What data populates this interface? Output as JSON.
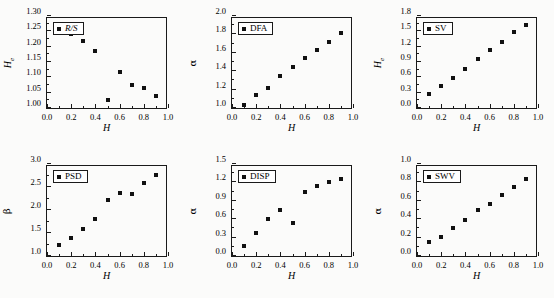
{
  "figure": {
    "background": "#fbfbfa",
    "marker_color": "#111111",
    "axis_color": "#1a1a1a"
  },
  "chart_data": [
    {
      "type": "scatter",
      "panel_index": 0,
      "legend": "R/S",
      "legend_italic": true,
      "title": "",
      "xlabel": "H",
      "ylabel": "H",
      "ylabel_sub": "e",
      "x": [
        0.1,
        0.2,
        0.3,
        0.4,
        0.5,
        0.6,
        0.7,
        0.8,
        0.9
      ],
      "values": [
        1.245,
        1.24,
        1.22,
        1.186,
        1.027,
        1.118,
        1.076,
        1.065,
        1.04
      ],
      "xlim": [
        0.0,
        1.0
      ],
      "ylim": [
        1.0,
        1.3
      ],
      "xticks": [
        0.0,
        0.2,
        0.4,
        0.6,
        0.8,
        1.0
      ],
      "xticklabels": [
        "0.0",
        "0.2",
        "0.4",
        "0.6",
        "0.8",
        "1.0"
      ],
      "yticks": [
        1.0,
        1.05,
        1.1,
        1.15,
        1.2,
        1.25,
        1.3
      ],
      "yticklabels": [
        "1.00",
        "1.05",
        "1.10",
        "1.15",
        "1.20",
        "1.25",
        "1.30"
      ],
      "grid": false,
      "legend_position": "top-left"
    },
    {
      "type": "scatter",
      "panel_index": 1,
      "legend": "DFA",
      "legend_italic": false,
      "title": "",
      "xlabel": "H",
      "ylabel": "α",
      "ylabel_sub": "",
      "x": [
        0.1,
        0.2,
        0.3,
        0.4,
        0.5,
        0.6,
        0.7,
        0.8,
        0.9
      ],
      "values": [
        1.03,
        1.14,
        1.22,
        1.35,
        1.45,
        1.54,
        1.63,
        1.72,
        1.81
      ],
      "xlim": [
        0.0,
        1.0
      ],
      "ylim": [
        1.0,
        2.0
      ],
      "xticks": [
        0.0,
        0.2,
        0.4,
        0.6,
        0.8,
        1.0
      ],
      "xticklabels": [
        "0.0",
        "0.2",
        "0.4",
        "0.6",
        "0.8",
        "1.0"
      ],
      "yticks": [
        1.0,
        1.2,
        1.4,
        1.6,
        1.8,
        2.0
      ],
      "yticklabels": [
        "1.0",
        "1.2",
        "1.4",
        "1.6",
        "1.8",
        "2.0"
      ],
      "grid": false,
      "legend_position": "top-left"
    },
    {
      "type": "scatter",
      "panel_index": 2,
      "legend": "SV",
      "legend_italic": false,
      "title": "",
      "xlabel": "H",
      "ylabel": "H",
      "ylabel_sub": "e",
      "x": [
        0.1,
        0.2,
        0.3,
        0.4,
        0.5,
        0.6,
        0.7,
        0.8,
        0.9
      ],
      "values": [
        0.28,
        0.43,
        0.59,
        0.77,
        0.96,
        1.13,
        1.3,
        1.48,
        1.63
      ],
      "xlim": [
        0.0,
        1.0
      ],
      "ylim": [
        0.0,
        1.8
      ],
      "xticks": [
        0.0,
        0.2,
        0.4,
        0.6,
        0.8,
        1.0
      ],
      "xticklabels": [
        "0.0",
        "0.2",
        "0.4",
        "0.6",
        "0.8",
        "1.0"
      ],
      "yticks": [
        0.0,
        0.3,
        0.6,
        0.9,
        1.2,
        1.5,
        1.8
      ],
      "yticklabels": [
        "0.0",
        "0.3",
        "0.6",
        "0.9",
        "1.2",
        "1.5",
        "1.8"
      ],
      "grid": false,
      "legend_position": "top-left"
    },
    {
      "type": "scatter",
      "panel_index": 3,
      "legend": "PSD",
      "legend_italic": false,
      "title": "",
      "xlabel": "H",
      "ylabel": "β",
      "ylabel_sub": "",
      "x": [
        0.1,
        0.2,
        0.3,
        0.4,
        0.5,
        0.6,
        0.7,
        0.8,
        0.9
      ],
      "values": [
        1.24,
        1.39,
        1.58,
        1.8,
        2.22,
        2.36,
        2.35,
        2.59,
        2.77
      ],
      "xlim": [
        0.0,
        1.0
      ],
      "ylim": [
        1.0,
        3.0
      ],
      "xticks": [
        0.0,
        0.2,
        0.4,
        0.6,
        0.8,
        1.0
      ],
      "xticklabels": [
        "0.0",
        "0.2",
        "0.4",
        "0.6",
        "0.8",
        "1.0"
      ],
      "yticks": [
        1.0,
        1.5,
        2.0,
        2.5,
        3.0
      ],
      "yticklabels": [
        "1.0",
        "1.5",
        "2.0",
        "2.5",
        "3.0"
      ],
      "grid": false,
      "legend_position": "top-left"
    },
    {
      "type": "scatter",
      "panel_index": 4,
      "legend": "DISP",
      "legend_italic": false,
      "title": "",
      "xlabel": "H",
      "ylabel": "α",
      "ylabel_sub": "",
      "x": [
        0.1,
        0.2,
        0.3,
        0.4,
        0.5,
        0.6,
        0.7,
        0.8,
        0.9
      ],
      "values": [
        0.16,
        0.37,
        0.6,
        0.75,
        0.54,
        1.05,
        1.14,
        1.21,
        1.25
      ],
      "xlim": [
        0.0,
        1.0
      ],
      "ylim": [
        0.0,
        1.5
      ],
      "xticks": [
        0.0,
        0.2,
        0.4,
        0.6,
        0.8,
        1.0
      ],
      "xticklabels": [
        "0.0",
        "0.2",
        "0.4",
        "0.6",
        "0.8",
        "1.0"
      ],
      "yticks": [
        0.0,
        0.3,
        0.6,
        0.9,
        1.2,
        1.5
      ],
      "yticklabels": [
        "0.0",
        "0.3",
        "0.6",
        "0.9",
        "1.2",
        "1.5"
      ],
      "grid": false,
      "legend_position": "top-left"
    },
    {
      "type": "scatter",
      "panel_index": 5,
      "legend": "SWV",
      "legend_italic": false,
      "title": "",
      "xlabel": "H",
      "ylabel": "α",
      "ylabel_sub": "",
      "x": [
        0.1,
        0.2,
        0.3,
        0.4,
        0.5,
        0.6,
        0.7,
        0.8,
        0.9
      ],
      "values": [
        0.15,
        0.21,
        0.3,
        0.39,
        0.5,
        0.57,
        0.66,
        0.75,
        0.84
      ],
      "xlim": [
        0.0,
        1.0
      ],
      "ylim": [
        0.0,
        1.0
      ],
      "xticks": [
        0.0,
        0.2,
        0.4,
        0.6,
        0.8,
        1.0
      ],
      "xticklabels": [
        "0.0",
        "0.2",
        "0.4",
        "0.6",
        "0.8",
        "1.0"
      ],
      "yticks": [
        0.0,
        0.2,
        0.4,
        0.6,
        0.8,
        1.0
      ],
      "yticklabels": [
        "0.0",
        "0.2",
        "0.4",
        "0.6",
        "0.8",
        "1.0"
      ],
      "grid": false,
      "legend_position": "top-left"
    }
  ]
}
